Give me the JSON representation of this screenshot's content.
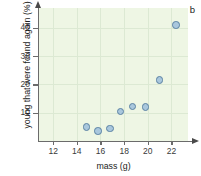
{
  "figure": {
    "panel_letter": "b",
    "background_color": "#eef6e4",
    "marker_fill": "#a9c7dd",
    "marker_stroke": "#5b82a3"
  },
  "chart_data": {
    "type": "scatter",
    "title": "",
    "xlabel": "mass (g)",
    "ylabel": "young that were found again (%)",
    "xlim": [
      10.8,
      23.4
    ],
    "ylim": [
      0,
      47
    ],
    "xticks": [
      12,
      14,
      16,
      18,
      20,
      22
    ],
    "yticks": [
      10,
      20,
      30,
      40
    ],
    "xticklabels": [
      "12",
      "14",
      "16",
      "18",
      "20",
      "22"
    ],
    "yticklabels": [
      "10",
      "20",
      "30",
      "40"
    ],
    "grid": true,
    "legend": "none",
    "series": [
      {
        "name": "young found again vs mass",
        "x": [
          14.8,
          15.8,
          16.8,
          17.7,
          18.7,
          19.8,
          21.0,
          22.4
        ],
        "y": [
          5.0,
          3.5,
          4.5,
          10.5,
          12.2,
          12.1,
          21.5,
          41.0
        ]
      }
    ]
  }
}
